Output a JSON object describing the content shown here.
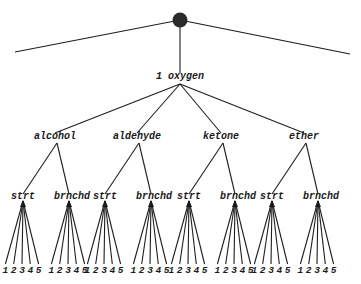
{
  "diagram": {
    "type": "tree",
    "root": {
      "shape": "filled-circle",
      "color": "#2a2a2a"
    },
    "level1": {
      "label": "1 oxygen"
    },
    "groups": [
      {
        "label": "alcohol",
        "branches": [
          {
            "label": "strt",
            "leaves": [
              "1",
              "2",
              "3",
              "4",
              "5"
            ]
          },
          {
            "label": "brnchd",
            "leaves": [
              "1",
              "2",
              "3",
              "4",
              "5"
            ]
          }
        ]
      },
      {
        "label": "aldehyde",
        "branches": [
          {
            "label": "strt",
            "leaves": [
              "1",
              "2",
              "3",
              "4",
              "5"
            ]
          },
          {
            "label": "brnchd",
            "leaves": [
              "1",
              "2",
              "3",
              "4",
              "5"
            ]
          }
        ]
      },
      {
        "label": "ketone",
        "branches": [
          {
            "label": "strt",
            "leaves": [
              "1",
              "2",
              "3",
              "4",
              "5"
            ]
          },
          {
            "label": "brnchd",
            "leaves": [
              "1",
              "2",
              "3",
              "4",
              "5"
            ]
          }
        ]
      },
      {
        "label": "ether",
        "branches": [
          {
            "label": "strt",
            "leaves": [
              "1",
              "2",
              "3",
              "4",
              "5"
            ]
          },
          {
            "label": "brnchd",
            "leaves": [
              "1",
              "2",
              "3",
              "4",
              "5"
            ]
          }
        ]
      }
    ]
  }
}
